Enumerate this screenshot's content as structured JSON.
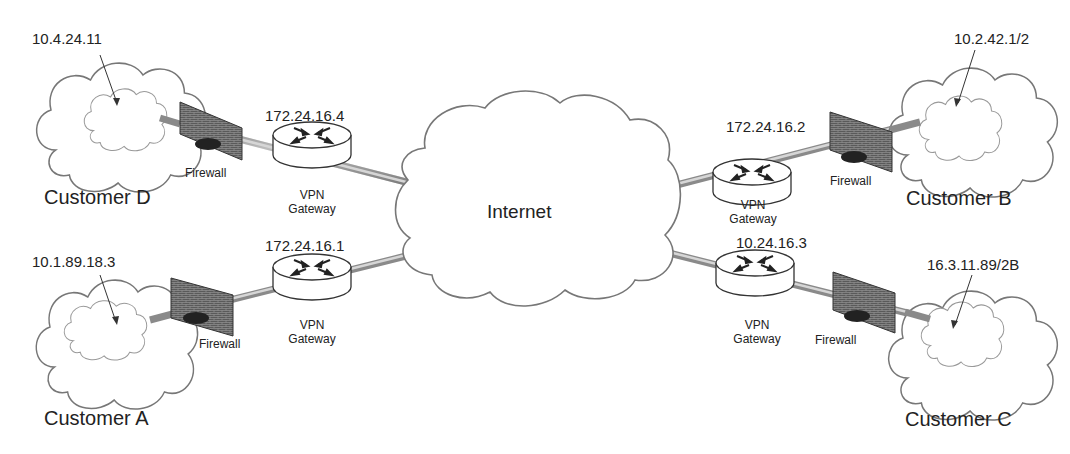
{
  "diagram": {
    "type": "network-topology",
    "center": {
      "label": "Internet"
    },
    "sites": [
      {
        "id": "D",
        "customer_label": "Customer D",
        "internal_ip": "10.4.24.11",
        "firewall_label": "Firewall",
        "gateway_label_line1": "VPN",
        "gateway_label_line2": "Gateway",
        "gateway_ip": "172.24.16.4",
        "position": "top-left"
      },
      {
        "id": "A",
        "customer_label": "Customer A",
        "internal_ip": "10.1.89.18.3",
        "firewall_label": "Firewall",
        "gateway_label_line1": "VPN",
        "gateway_label_line2": "Gateway",
        "gateway_ip": "172.24.16.1",
        "position": "bottom-left"
      },
      {
        "id": "B",
        "customer_label": "Customer B",
        "internal_ip": "10.2.42.1/2",
        "firewall_label": "Firewall",
        "gateway_label_line1": "VPN",
        "gateway_label_line2": "Gateway",
        "gateway_ip": "172.24.16.2",
        "position": "top-right"
      },
      {
        "id": "C",
        "customer_label": "Customer C",
        "internal_ip": "16.3.11.89/2B",
        "firewall_label": "Firewall",
        "gateway_label_line1": "VPN",
        "gateway_label_line2": "Gateway",
        "gateway_ip": "10.24.16.3",
        "position": "bottom-right"
      }
    ],
    "icons": {
      "cloud": "cloud-icon",
      "firewall": "firewall-icon",
      "router": "router-icon"
    },
    "colors": {
      "outline": "#6b6b6b",
      "link": "#9a9a9a",
      "firewall": "#555555",
      "text": "#222222"
    }
  }
}
